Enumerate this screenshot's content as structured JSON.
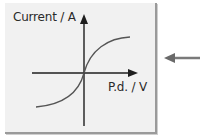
{
  "diagram": {
    "y_axis_label": "Current / A",
    "x_axis_label": "P.d. / V",
    "curve": "S-shaped I-V characteristic through origin, flattening at both ends",
    "pointer_arrow": "left-pointing-arrow"
  },
  "colors": {
    "panel_bg": "#f1f1f1",
    "axis": "#1e1e1e",
    "curve": "#555555",
    "arrow": "#7a7a7a"
  }
}
